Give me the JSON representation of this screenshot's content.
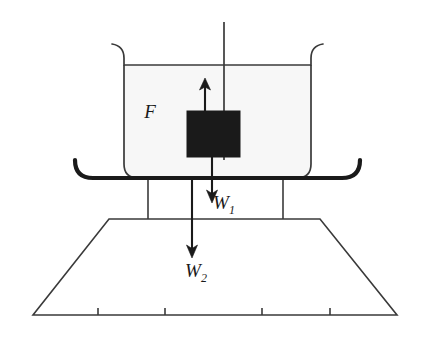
{
  "figure": {
    "type": "free-body-diagram",
    "background_color": "#ffffff",
    "stroke_color": "#333333",
    "bold_stroke_color": "#1a1a1a",
    "container_fill": "#f7f7f7",
    "block_fill": "#1a1a1a"
  },
  "labels": {
    "buoyant_force": {
      "symbol": "F",
      "subscript": "",
      "x": 150,
      "y": 118
    },
    "weight_one": {
      "symbol": "W",
      "subscript": "1",
      "x": 224,
      "y": 209
    },
    "weight_two": {
      "symbol": "W",
      "subscript": "2",
      "x": 196,
      "y": 277
    }
  },
  "arrows": {
    "up_arrow": {
      "name": "buoyant-force-arrow",
      "direction": "up",
      "x": 205,
      "y_start": 113,
      "y_end": 80
    },
    "down_arrow_w1": {
      "name": "weight-one-arrow",
      "direction": "down",
      "x": 212,
      "y_start": 157,
      "y_end": 201
    },
    "down_arrow_w2": {
      "name": "weight-two-arrow",
      "direction": "down",
      "x": 192,
      "y_start": 180,
      "y_end": 256
    }
  },
  "geometry": {
    "string": {
      "x": 224,
      "y_top": 22,
      "y_bottom": 160
    },
    "container": {
      "left": 124,
      "right": 311,
      "top": 65,
      "bottom": 178,
      "corner_radius": 14
    },
    "block": {
      "left": 187,
      "top": 111,
      "width": 53,
      "height": 46
    },
    "shelf": {
      "left": 75,
      "right": 360,
      "y": 178,
      "thickness": 4,
      "hook_radius": 18
    },
    "legs": [
      {
        "x": 148
      },
      {
        "x": 283
      }
    ],
    "trapezoid": {
      "top_left_x": 109,
      "top_right_x": 320,
      "top_y": 219,
      "bottom_left_x": 33,
      "bottom_right_x": 397,
      "bottom_y": 315
    },
    "ground_ticks": [
      98,
      165,
      262,
      330
    ],
    "tick_height": 7
  }
}
